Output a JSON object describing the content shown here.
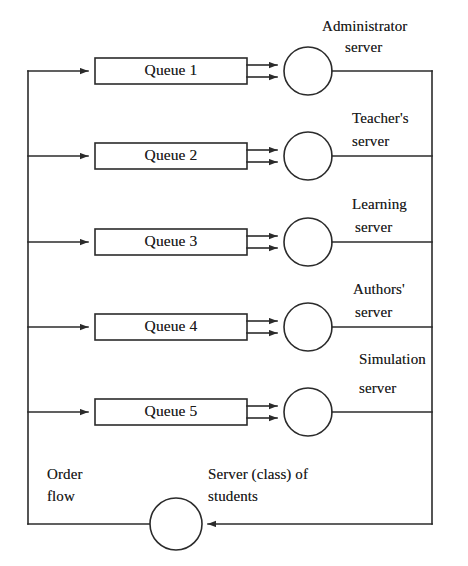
{
  "diagram": {
    "type": "queueing-network",
    "line_color": "#2b2b2b",
    "text_color": "#1b1b1b",
    "background": "#ffffff",
    "queues": [
      {
        "id": "queue-1",
        "label": "Queue 1",
        "server_label_line1": "Administrator",
        "server_label_line2": "server",
        "row_y": 71
      },
      {
        "id": "queue-2",
        "label": "Queue 2",
        "server_label_line1": "Teacher's",
        "server_label_line2": "server",
        "row_y": 156
      },
      {
        "id": "queue-3",
        "label": "Queue 3",
        "server_label_line1": "Learning",
        "server_label_line2": "server",
        "row_y": 242
      },
      {
        "id": "queue-4",
        "label": "Queue 4",
        "server_label_line1": "Authors'",
        "server_label_line2": "server",
        "row_y": 327
      },
      {
        "id": "queue-5",
        "label": "Queue 5",
        "server_label_line1": "Simulation",
        "server_label_line2": "server",
        "row_y": 412
      }
    ],
    "notes": {
      "order_flow_line1": "Order",
      "order_flow_line2": "flow",
      "student_server_line1": "Server (class) of",
      "student_server_line2": "students"
    },
    "feedback_server": {
      "id": "student-server",
      "center_x": 176,
      "center_y": 524,
      "radius": 26
    },
    "geometry": {
      "left_rail_x": 28,
      "right_rail_x": 432,
      "queue_box_left": 95,
      "queue_box_right": 247,
      "queue_box_height": 26,
      "server_center_x": 308,
      "server_radius": 24,
      "bottom_rail_y": 524
    }
  }
}
